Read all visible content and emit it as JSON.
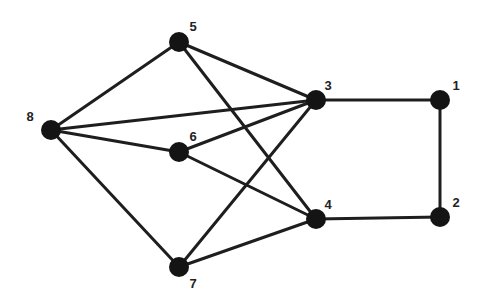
{
  "diagram": {
    "type": "undirected-graph",
    "node_color": "#141414",
    "edge_color": "#1e1e1e",
    "label_color": "#222222",
    "nodes": [
      {
        "id": "1",
        "label": "1",
        "x": 440,
        "y": 100,
        "lx": 456,
        "ly": 90
      },
      {
        "id": "2",
        "label": "2",
        "x": 440,
        "y": 217,
        "lx": 456,
        "ly": 207
      },
      {
        "id": "3",
        "label": "3",
        "x": 316,
        "y": 100,
        "lx": 328,
        "ly": 90
      },
      {
        "id": "4",
        "label": "4",
        "x": 316,
        "y": 219,
        "lx": 328,
        "ly": 209
      },
      {
        "id": "5",
        "label": "5",
        "x": 179,
        "y": 42,
        "lx": 193,
        "ly": 31
      },
      {
        "id": "6",
        "label": "6",
        "x": 179,
        "y": 152,
        "lx": 193,
        "ly": 141
      },
      {
        "id": "7",
        "label": "7",
        "x": 179,
        "y": 267,
        "lx": 193,
        "ly": 288
      },
      {
        "id": "8",
        "label": "8",
        "x": 51,
        "y": 130,
        "lx": 30,
        "ly": 121
      }
    ],
    "edges": [
      [
        "8",
        "5"
      ],
      [
        "8",
        "3"
      ],
      [
        "8",
        "6"
      ],
      [
        "8",
        "7"
      ],
      [
        "5",
        "3"
      ],
      [
        "5",
        "4"
      ],
      [
        "6",
        "3"
      ],
      [
        "6",
        "4"
      ],
      [
        "7",
        "3"
      ],
      [
        "7",
        "4"
      ],
      [
        "3",
        "1"
      ],
      [
        "1",
        "2"
      ],
      [
        "2",
        "4"
      ]
    ]
  }
}
